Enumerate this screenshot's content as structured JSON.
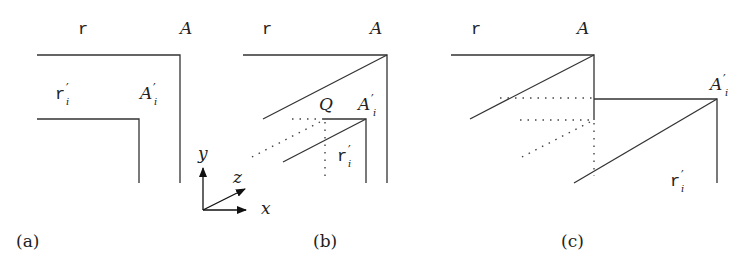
{
  "panels": [
    {
      "caption": "(a)",
      "labels": {
        "r": "r",
        "A": "A",
        "r_i": "r",
        "A_i": "A",
        "prime": "′",
        "sub_i": "i"
      }
    },
    {
      "caption": "(b)",
      "labels": {
        "r": "r",
        "A": "A",
        "Q": "Q",
        "r_i": "r",
        "A_i": "A",
        "prime": "′",
        "sub_i": "i"
      },
      "axes": {
        "x": "x",
        "y": "y",
        "z": "z"
      }
    },
    {
      "caption": "(c)",
      "labels": {
        "r": "r",
        "A": "A",
        "r_i": "r",
        "A_i": "A",
        "prime": "′",
        "sub_i": "i"
      }
    }
  ]
}
